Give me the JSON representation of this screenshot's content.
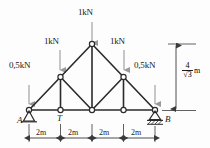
{
  "diagram": {
    "colors": {
      "member": "#2b2b2b",
      "load_arrow": "#9a9a9a",
      "dimension": "#3a3a3a",
      "node_fill": "#ffffff",
      "background": "#fdfdfd"
    },
    "loads": [
      {
        "id": "load-left-support",
        "label": "0,5kN",
        "magnitude": 0.5,
        "unit": "kN",
        "direction": "down",
        "at_node": "A"
      },
      {
        "id": "load-upper-left",
        "label": "1kN",
        "magnitude": 1.0,
        "unit": "kN",
        "direction": "down",
        "at_node": "upper-left"
      },
      {
        "id": "load-apex",
        "label": "1kN",
        "magnitude": 1.0,
        "unit": "kN",
        "direction": "down",
        "at_node": "apex"
      },
      {
        "id": "load-upper-right",
        "label": "1kN",
        "magnitude": 1.0,
        "unit": "kN",
        "direction": "down",
        "at_node": "upper-right"
      },
      {
        "id": "load-right-support",
        "label": "0,5kN",
        "magnitude": 0.5,
        "unit": "kN",
        "direction": "down",
        "at_node": "B"
      }
    ],
    "node_labels": [
      {
        "id": "node-a",
        "label": "A"
      },
      {
        "id": "node-t",
        "label": "T"
      },
      {
        "id": "node-b",
        "label": "B"
      }
    ],
    "supports": [
      {
        "id": "support-a",
        "type": "pin",
        "at_node": "A"
      },
      {
        "id": "support-b",
        "type": "roller",
        "at_node": "B"
      }
    ],
    "span_dimensions": {
      "segments": [
        "2m",
        "2m",
        "2m",
        "2m"
      ],
      "total_span_m": 8
    },
    "height_dimension": {
      "numerator": "4",
      "denominator": "√3",
      "unit": "m",
      "value_text": "4/√3 m"
    }
  }
}
